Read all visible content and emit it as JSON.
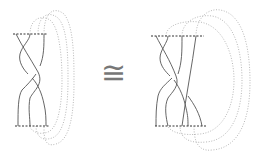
{
  "diagram": {
    "relation_symbol": "≅",
    "colors": {
      "strand": "#555555",
      "dashed_boundary": "#333333",
      "dotted_closure": "#aaaaaa",
      "background": "#ffffff"
    },
    "left_braid": {
      "strand_count": 3,
      "closure_loops": 3,
      "description": "3-strand braid with crossings between boundary lines, closed by 3 dotted arcs on the right"
    },
    "right_braid": {
      "strand_count": 4,
      "closure_loops": 3,
      "description": "equivalent braid with extra strand, closed by 3 dotted arcs on the right"
    }
  }
}
